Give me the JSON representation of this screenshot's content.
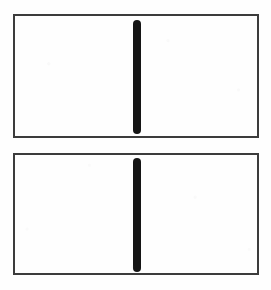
{
  "figure": {
    "title": "",
    "background_color": "#fefefe",
    "canvas": {
      "width": 271,
      "height": 290
    },
    "style": {
      "frame_border_color": "#3c3c3c",
      "frame_border_width_px": 2,
      "frame_fill_color": "#fefefe",
      "stroke_color": "#151515"
    },
    "panels": [
      {
        "id": "panel-top",
        "label": "",
        "x": 13,
        "y": 14,
        "width": 246,
        "height": 124,
        "marks": [
          {
            "id": "vertical-line-top",
            "type": "vertical-line",
            "center_x": 137,
            "top": 20,
            "bottom": 134,
            "length": 114,
            "thickness": 8,
            "color": "#151515",
            "cap": "round"
          }
        ]
      },
      {
        "id": "panel-bottom",
        "label": "",
        "x": 13,
        "y": 153,
        "width": 246,
        "height": 122,
        "marks": [
          {
            "id": "vertical-line-bottom",
            "type": "vertical-line",
            "center_x": 137,
            "top": 158,
            "bottom": 272,
            "length": 114,
            "thickness": 8,
            "color": "#151515",
            "cap": "round"
          }
        ]
      }
    ]
  }
}
